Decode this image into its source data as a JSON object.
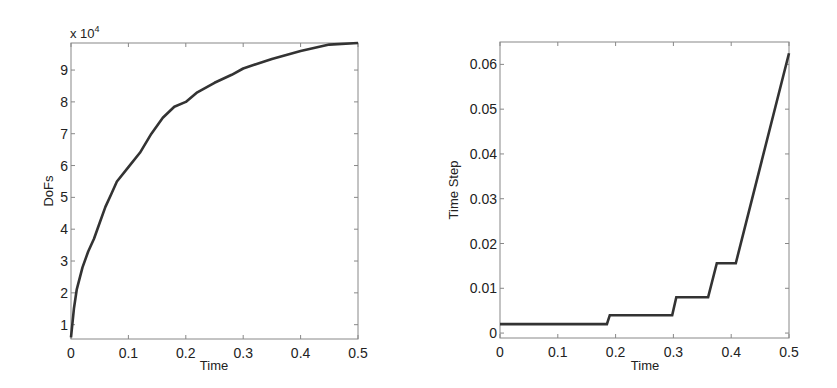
{
  "chart_data": [
    {
      "type": "line",
      "title": "",
      "xlabel": "Time",
      "ylabel": "DoFs",
      "y_multiplier_label": "x 10",
      "y_multiplier_exp": "4",
      "xlim": [
        0,
        0.5
      ],
      "ylim": [
        0.55,
        9.85
      ],
      "grid": false,
      "legend": null,
      "xticks": [
        "0",
        "0.1",
        "0.2",
        "0.3",
        "0.4",
        "0.5"
      ],
      "yticks": [
        "1",
        "2",
        "3",
        "4",
        "5",
        "6",
        "7",
        "8",
        "9"
      ],
      "series": [
        {
          "name": "DoFs",
          "color": "#333333",
          "x": [
            0,
            0.005,
            0.01,
            0.02,
            0.03,
            0.04,
            0.05,
            0.06,
            0.07,
            0.08,
            0.1,
            0.12,
            0.14,
            0.16,
            0.18,
            0.2,
            0.22,
            0.25,
            0.28,
            0.3,
            0.35,
            0.4,
            0.45,
            0.5
          ],
          "y": [
            0.6,
            1.5,
            2.1,
            2.8,
            3.3,
            3.7,
            4.2,
            4.7,
            5.1,
            5.5,
            5.95,
            6.4,
            7.0,
            7.5,
            7.85,
            8.0,
            8.3,
            8.6,
            8.85,
            9.05,
            9.35,
            9.6,
            9.8,
            9.85
          ]
        }
      ]
    },
    {
      "type": "line",
      "title": "",
      "xlabel": "Time",
      "ylabel": "Time Step",
      "xlim": [
        0,
        0.5
      ],
      "ylim": [
        -0.0011,
        0.065
      ],
      "grid": false,
      "legend": null,
      "xticks": [
        "0",
        "0.1",
        "0.2",
        "0.3",
        "0.4",
        "0.5"
      ],
      "yticks": [
        "0",
        "0.01",
        "0.02",
        "0.03",
        "0.04",
        "0.05",
        "0.06"
      ],
      "series": [
        {
          "name": "Time Step",
          "color": "#333333",
          "x": [
            0,
            0.185,
            0.19,
            0.298,
            0.305,
            0.36,
            0.375,
            0.408,
            0.5
          ],
          "y": [
            0.002,
            0.002,
            0.004,
            0.004,
            0.008,
            0.008,
            0.0156,
            0.0156,
            0.0625
          ]
        }
      ]
    }
  ]
}
